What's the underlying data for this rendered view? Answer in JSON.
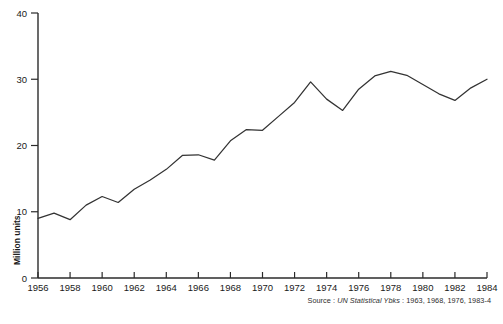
{
  "chart_data": {
    "type": "line",
    "title": "",
    "xlabel": "",
    "ylabel": "Million units",
    "xlim": [
      1956,
      1984
    ],
    "ylim": [
      0,
      40
    ],
    "grid": false,
    "legend": null,
    "x_ticks": [
      "1956",
      "1958",
      "1960",
      "1962",
      "1964",
      "1966",
      "1968",
      "1970",
      "1972",
      "1974",
      "1976",
      "1978",
      "1980",
      "1982",
      "1984"
    ],
    "y_ticks": [
      "0",
      "10",
      "20",
      "30",
      "40"
    ],
    "x": [
      1956,
      1957,
      1958,
      1959,
      1960,
      1961,
      1962,
      1963,
      1964,
      1965,
      1966,
      1967,
      1968,
      1969,
      1970,
      1971,
      1972,
      1973,
      1974,
      1975,
      1976,
      1977,
      1978,
      1979,
      1980,
      1981,
      1982,
      1983,
      1984
    ],
    "values": [
      9.0,
      9.8,
      8.8,
      11.0,
      12.3,
      11.4,
      13.4,
      14.8,
      16.4,
      18.5,
      18.6,
      17.8,
      20.7,
      22.4,
      22.3,
      24.4,
      26.5,
      29.6,
      27.0,
      25.3,
      28.5,
      30.5,
      31.2,
      30.6,
      29.2,
      27.8,
      26.8,
      28.7,
      30.0
    ],
    "series": [
      {
        "name": "Million units",
        "values": [
          9.0,
          9.8,
          8.8,
          11.0,
          12.3,
          11.4,
          13.4,
          14.8,
          16.4,
          18.5,
          18.6,
          17.8,
          20.7,
          22.4,
          22.3,
          24.4,
          26.5,
          29.6,
          27.0,
          25.3,
          28.5,
          30.5,
          31.2,
          30.6,
          29.2,
          27.8,
          26.8,
          28.7,
          30.0
        ],
        "color": "#333333"
      }
    ],
    "annotations": [
      "Source : UN Statistical Ybks : 1963, 1968, 1976, 1983-4"
    ]
  },
  "axes": {
    "y_label": "Million units",
    "y_tick_labels": [
      "40",
      "30",
      "20",
      "10",
      "0"
    ],
    "x_tick_labels": [
      "1956",
      "1958",
      "1960",
      "1962",
      "1964",
      "1966",
      "1968",
      "1970",
      "1972",
      "1974",
      "1976",
      "1978",
      "1980",
      "1982",
      "1984"
    ]
  },
  "notes": {
    "source_prefix": "Source : ",
    "source_ref": "UN Statistical Ybks",
    "source_suffix": " : 1963, 1968, 1976, 1983-4",
    "figure_caption": ""
  },
  "colors": {
    "line": "#333333",
    "axis": "#2b2b2b",
    "text": "#1a1a1a",
    "background": "#ffffff"
  }
}
